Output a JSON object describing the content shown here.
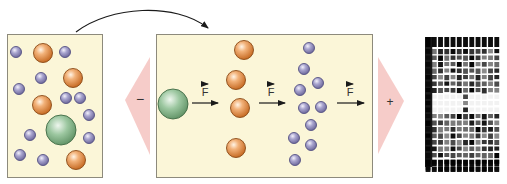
{
  "diagram": {
    "colors": {
      "panel_fill": "#fbf6d8",
      "panel_border": "#8d8a7c",
      "electrode_fill": "#f4c3c0",
      "large_molecule": "#7fae83",
      "medium_molecule": "#e08f43",
      "small_molecule": "#8b87b5",
      "arrow": "#1a1a1a",
      "gel_band": "#000000"
    },
    "electrodes": {
      "negative_label": "−",
      "positive_label": "+"
    },
    "force_labels": [
      "F",
      "F",
      "F"
    ],
    "sample_panel": {
      "label": "mixture",
      "molecules": {
        "large": 1,
        "medium": 5,
        "small": 13
      }
    },
    "separation_panel": {
      "groups": [
        {
          "size": "large",
          "count": 1
        },
        {
          "size": "medium",
          "count": 4
        },
        {
          "size": "small",
          "count": 10
        }
      ]
    },
    "gel_image": {
      "description": "autoradiograph of electrophoresis gel",
      "lanes": 12
    }
  }
}
